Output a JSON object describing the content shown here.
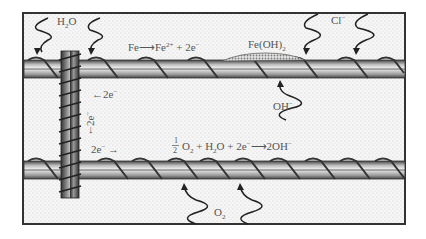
{
  "diagram": {
    "colors": {
      "frame": "#333333",
      "concrete_fill": "#f4f4f4",
      "concrete_dots": "#cfcfcf",
      "bar_dark": "#555555",
      "bar_light": "#d8d8d8",
      "rust_fill": "#bdbdbd",
      "text": "#555555"
    },
    "labels": {
      "water": {
        "main": "H",
        "sub": "2",
        "tail": "O"
      },
      "chloride": {
        "main": "Cl",
        "sup": "−"
      },
      "anodic_reaction": {
        "a": "Fe",
        "arrow": "⟶",
        "b": "Fe",
        "b_sup": "2+",
        "c": " + 2e",
        "c_sup": "−"
      },
      "rust": {
        "main": "Fe(OH)",
        "sub": "2"
      },
      "hydroxide": {
        "main": "OH",
        "sup": "−"
      },
      "electron_left": {
        "arrow": "←",
        "text": "2e",
        "sup": "−"
      },
      "electron_down": {
        "text": "2e",
        "sup": "−",
        "arrow": "↓"
      },
      "electron_right": {
        "text": "2e",
        "sup": "−",
        "arrow": "→"
      },
      "cathodic_reaction": {
        "frac_num": "1",
        "frac_den": "2",
        "o2": "O",
        "o2_sub": "2",
        "plus1": " + H",
        "h2o_sub": "2",
        "h2o_tail": "O + 2e",
        "e_sup": "−",
        "arrow": "⟶",
        "product": "2OH",
        "product_sup": "−"
      },
      "oxygen": {
        "main": "O",
        "sub": "2"
      }
    }
  }
}
